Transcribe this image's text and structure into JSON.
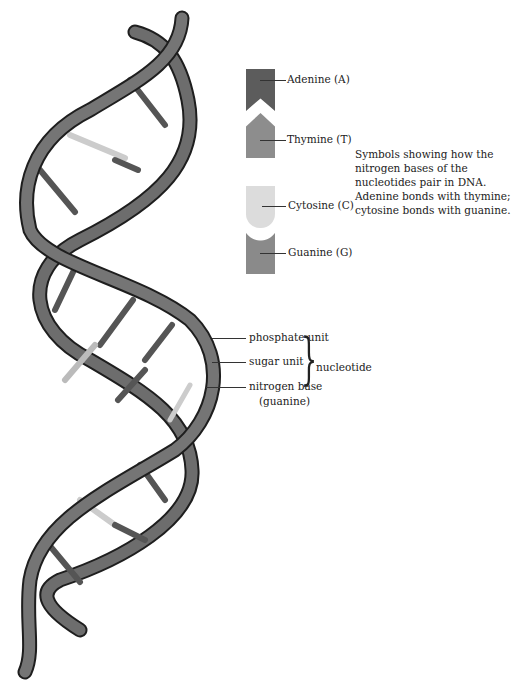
{
  "legend": {
    "bases": [
      {
        "label": "Adenine (A)",
        "color": "#5c5c5c"
      },
      {
        "label": "Thymine (T)",
        "color": "#8d8d8d"
      },
      {
        "label": "Cytosine (C)",
        "color": "#dcdcdc"
      },
      {
        "label": "Guanine (G)",
        "color": "#8a8a8a"
      }
    ],
    "description": "Symbols showing how the nitrogen bases of the nucleotides pair in DNA. Adenine bonds with thymine; cytosine bonds with guanine."
  },
  "nucleotide_callouts": {
    "items": [
      "phosphate unit",
      "sugar unit",
      "nitrogen base",
      "(guanine)"
    ],
    "group_label": "nucleotide"
  },
  "colors": {
    "strand": "#6a6a6a",
    "strand_outline": "#1e1e1e",
    "phosphate_band": "#3a3a3a"
  }
}
